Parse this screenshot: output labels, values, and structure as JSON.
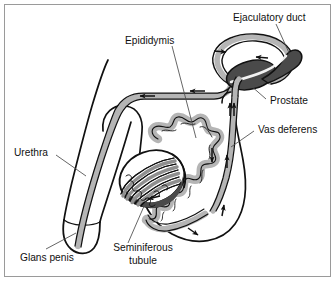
{
  "figure": {
    "frame_color": "#9a9a9a",
    "background_color": "#ffffff",
    "line_color": "#111111",
    "fill_light_gray": "#b5b5b5",
    "fill_mid_gray": "#8f8f8f",
    "fill_dark_gray": "#4a4a4a",
    "fill_white": "#ffffff"
  },
  "labels": {
    "ejaculatory_duct": "Ejaculatory duct",
    "epididymis": "Epididymis",
    "prostate": "Prostate",
    "vas_deferens": "Vas deferens",
    "urethra": "Urethra",
    "glans_penis": "Glans penis",
    "seminiferous_tubule_line1": "Seminiferous",
    "seminiferous_tubule_line2": "tubule"
  },
  "structures": [
    {
      "name": "penis-shaft",
      "label": "Penis shaft",
      "fill": "#ffffff"
    },
    {
      "name": "glans-penis",
      "label": "Glans penis",
      "fill": "#ffffff"
    },
    {
      "name": "urethra-tube",
      "label": "Urethra",
      "fill": "#b5b5b5"
    },
    {
      "name": "vas-deferens-tube",
      "label": "Vas deferens",
      "fill": "#b5b5b5"
    },
    {
      "name": "prostate-gland",
      "label": "Prostate",
      "fill": "#4a4a4a"
    },
    {
      "name": "ejaculatory-duct",
      "label": "Ejaculatory duct",
      "fill": "#4a4a4a"
    },
    {
      "name": "seminal-vesicle-loop",
      "label": "Seminal vesicle loop",
      "fill": "#b5b5b5"
    },
    {
      "name": "testis",
      "label": "Testis",
      "fill": "#ffffff"
    },
    {
      "name": "seminiferous-tubules",
      "label": "Seminiferous tubule",
      "fill": "#8f8f8f"
    },
    {
      "name": "epididymis-coil",
      "label": "Epididymis",
      "fill": "#b5b5b5"
    },
    {
      "name": "scrotum-outline",
      "label": "Scrotum",
      "fill": "#ffffff"
    }
  ],
  "flow_arrows": {
    "count": 9,
    "description": "Arrows indicate direction of sperm transport",
    "directions": [
      "left",
      "left",
      "left",
      "up",
      "up",
      "up",
      "down",
      "right",
      "right"
    ]
  }
}
